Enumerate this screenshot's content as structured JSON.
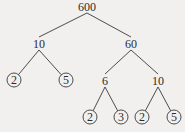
{
  "diagram": {
    "type": "factor-tree",
    "colors": {
      "background": "#f1f0ee",
      "ink": "#2b2b2b"
    },
    "nodes": [
      {
        "id": "n600",
        "label": "600",
        "x": 87,
        "y": 7,
        "circled": false
      },
      {
        "id": "n10a",
        "label": "10",
        "x": 39,
        "y": 44,
        "circled": false
      },
      {
        "id": "n60",
        "label": "60",
        "x": 131,
        "y": 44,
        "circled": false
      },
      {
        "id": "n2a",
        "label": "2",
        "x": 14,
        "y": 80,
        "circled": true
      },
      {
        "id": "n5a",
        "label": "5",
        "x": 66,
        "y": 80,
        "circled": true
      },
      {
        "id": "n6",
        "label": "6",
        "x": 105,
        "y": 81,
        "circled": false
      },
      {
        "id": "n10b",
        "label": "10",
        "x": 158,
        "y": 81,
        "circled": false
      },
      {
        "id": "n2b",
        "label": "2",
        "x": 90,
        "y": 117,
        "circled": true
      },
      {
        "id": "n3",
        "label": "3",
        "x": 121,
        "y": 117,
        "circled": true
      },
      {
        "id": "n2c",
        "label": "2",
        "x": 142,
        "y": 117,
        "circled": true
      },
      {
        "id": "n5b",
        "label": "5",
        "x": 174,
        "y": 117,
        "circled": true
      }
    ],
    "edges": [
      [
        "n600",
        "n10a"
      ],
      [
        "n600",
        "n60"
      ],
      [
        "n10a",
        "n2a"
      ],
      [
        "n10a",
        "n5a"
      ],
      [
        "n60",
        "n6"
      ],
      [
        "n60",
        "n10b"
      ],
      [
        "n6",
        "n2b"
      ],
      [
        "n6",
        "n3"
      ],
      [
        "n10b",
        "n2c"
      ],
      [
        "n10b",
        "n5b"
      ]
    ]
  }
}
